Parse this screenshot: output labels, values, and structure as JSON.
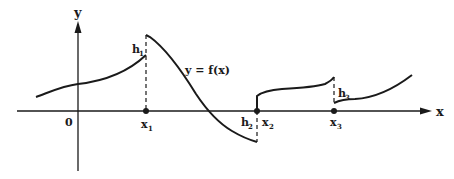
{
  "diagram": {
    "axes": {
      "x_label": "x",
      "y_label": "y",
      "origin_label": "0"
    },
    "function_label": "y = f(x)",
    "points": [
      {
        "name": "x1",
        "base": "x",
        "sub": "1"
      },
      {
        "name": "x2",
        "base": "x",
        "sub": "2"
      },
      {
        "name": "x3",
        "base": "x",
        "sub": "3"
      }
    ],
    "jumps": [
      {
        "name": "h1",
        "base": "h",
        "sub": "1"
      },
      {
        "name": "h2",
        "base": "h",
        "sub": "2"
      },
      {
        "name": "h3",
        "base": "h",
        "sub": "3"
      }
    ],
    "colors": {
      "ink": "#1a1a1a",
      "background": "#ffffff"
    }
  }
}
